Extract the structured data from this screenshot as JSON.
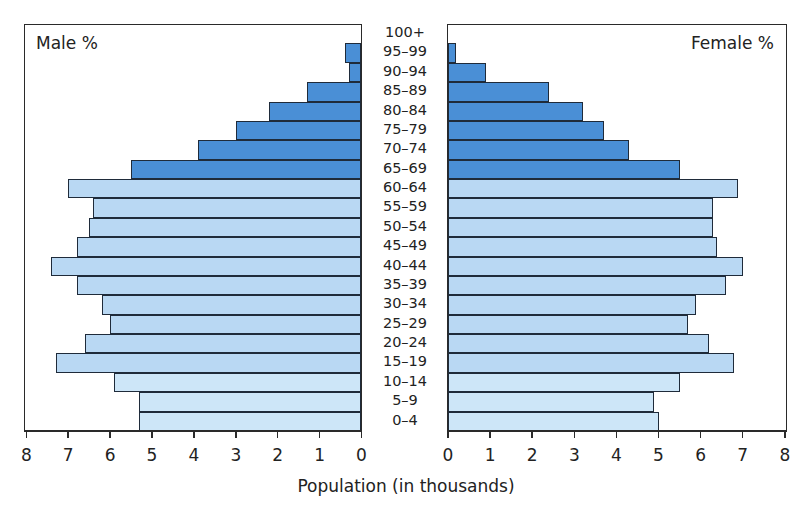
{
  "chart_data": {
    "type": "bar",
    "subtype": "population-pyramid",
    "title": "",
    "xlabel": "Population (in thousands)",
    "ylabel": "",
    "left_panel_label": "Male %",
    "right_panel_label": "Female %",
    "categories": [
      "0–4",
      "5–9",
      "10–14",
      "15–19",
      "20–24",
      "25–29",
      "30–34",
      "35–39",
      "40–44",
      "45–49",
      "50–54",
      "55–59",
      "60–64",
      "65–69",
      "70–74",
      "75–79",
      "80–84",
      "85–89",
      "90–94",
      "95–99",
      "100+"
    ],
    "series": [
      {
        "name": "Male %",
        "side": "left",
        "values": [
          5.3,
          5.3,
          5.9,
          7.3,
          6.6,
          6.0,
          6.2,
          6.8,
          7.4,
          6.8,
          6.5,
          6.4,
          7.0,
          5.5,
          3.9,
          3.0,
          2.2,
          1.3,
          0.3,
          0.4,
          0
        ]
      },
      {
        "name": "Female %",
        "side": "right",
        "values": [
          5.0,
          4.9,
          5.5,
          6.8,
          6.2,
          5.7,
          5.9,
          6.6,
          7.0,
          6.4,
          6.3,
          6.3,
          6.9,
          5.5,
          4.3,
          3.7,
          3.2,
          2.4,
          0.9,
          0.2,
          0
        ]
      }
    ],
    "xlim_left": [
      8,
      0
    ],
    "xlim_right": [
      0,
      8
    ],
    "x_ticks_left": [
      "8",
      "7",
      "6",
      "5",
      "4",
      "3",
      "2",
      "1",
      "0"
    ],
    "x_ticks_right": [
      "0",
      "1",
      "2",
      "3",
      "4",
      "5",
      "6",
      "7",
      "8"
    ],
    "grid": false,
    "legend": "none (panel labels inside plot areas)",
    "colors": {
      "age_65_plus": "#4a8fd6",
      "age_15_64": "#b9d8f3",
      "age_0_14": "#cde6f8",
      "bar_border": "#1f2b3a"
    }
  }
}
